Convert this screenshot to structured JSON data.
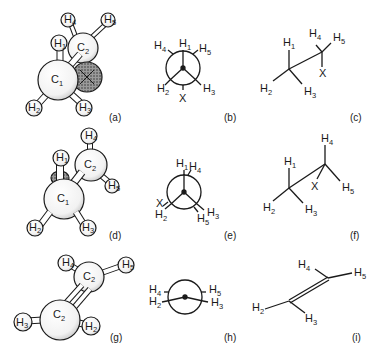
{
  "figure": {
    "rows": [
      {
        "model": {
          "caption": "(a)",
          "atoms": {
            "c1": "C",
            "c1_sub": "1",
            "c2": "C",
            "c2_sub": "2",
            "h1": "H",
            "h1_sub": "1",
            "h2": "H",
            "h2_sub": "2",
            "h3": "H",
            "h3_sub": "3",
            "h4": "H",
            "h4_sub": "4",
            "h5": "H",
            "h5_sub": "5",
            "x": "X"
          }
        },
        "newman": {
          "caption": "(b)",
          "labels": {
            "h1": "H",
            "h1_sub": "1",
            "h4": "H",
            "h4_sub": "4",
            "h5": "H",
            "h5_sub": "5",
            "h2": "H",
            "h2_sub": "2",
            "h3": "H",
            "h3_sub": "3",
            "x": "X"
          }
        },
        "sawhorse": {
          "caption": "(c)",
          "labels": {
            "h1": "H",
            "h1_sub": "1",
            "h2": "H",
            "h2_sub": "2",
            "h3": "H",
            "h3_sub": "3",
            "h4": "H",
            "h4_sub": "4",
            "h5": "H",
            "h5_sub": "5",
            "x": "X"
          }
        }
      },
      {
        "model": {
          "caption": "(d)",
          "atoms": {
            "c1": "C",
            "c1_sub": "1",
            "c2": "C",
            "c2_sub": "2",
            "h1": "H",
            "h1_sub": "1",
            "h2": "H",
            "h2_sub": "2",
            "h3": "H",
            "h3_sub": "3",
            "h4": "H",
            "h4_sub": "4",
            "h5": "H",
            "h5_sub": "5"
          }
        },
        "newman": {
          "caption": "(e)",
          "labels": {
            "h1": "H",
            "h1_sub": "1",
            "h4": "H",
            "h4_sub": "4",
            "x": "X",
            "h2": "H",
            "h2_sub": "2",
            "h5": "H",
            "h5_sub": "5",
            "h3": "H",
            "h3_sub": "3"
          }
        },
        "sawhorse": {
          "caption": "(f)",
          "labels": {
            "h1": "H",
            "h1_sub": "1",
            "h2": "H",
            "h2_sub": "2",
            "h3": "H",
            "h3_sub": "3",
            "h4": "H",
            "h4_sub": "4",
            "h5": "H",
            "h5_sub": "5",
            "x": "X"
          }
        }
      },
      {
        "model": {
          "caption": "(g)",
          "atoms": {
            "c_top": "C",
            "c_top_sub": "2",
            "c_bottom": "C",
            "c_bottom_sub": "2",
            "h_top_left": "H",
            "h_top_left_sub": "4",
            "h_top_right": "H",
            "h_top_right_sub": "5",
            "h_left": "H",
            "h_left_sub": "3",
            "h_right": "H",
            "h_right_sub": "2"
          }
        },
        "newman": {
          "caption": "(h)",
          "labels": {
            "h4": "H",
            "h4_sub": "4",
            "h2": "H",
            "h2_sub": "2",
            "h5": "H",
            "h5_sub": "5",
            "h3": "H",
            "h3_sub": "3"
          }
        },
        "sawhorse": {
          "caption": "(i)",
          "labels": {
            "h4": "H",
            "h4_sub": "4",
            "h5": "H",
            "h5_sub": "5",
            "h2": "H",
            "h2_sub": "2",
            "h3": "H",
            "h3_sub": "3"
          }
        }
      }
    ]
  }
}
